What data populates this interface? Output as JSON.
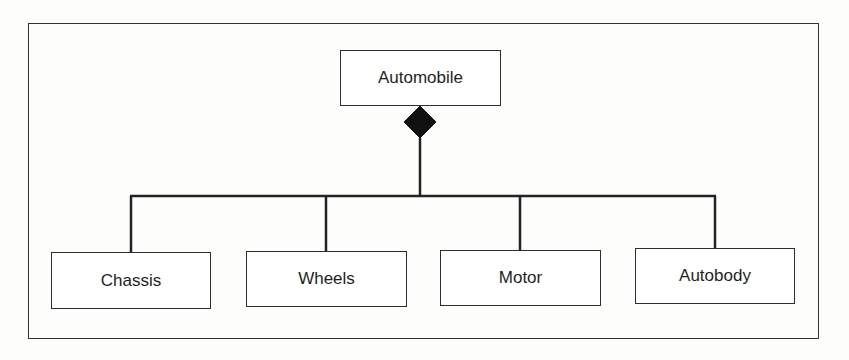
{
  "diagram": {
    "type": "uml-composition",
    "parent": {
      "label": "Automobile"
    },
    "relationship": {
      "kind": "composition",
      "marker": "filled-diamond-icon"
    },
    "children": [
      {
        "label": "Chassis"
      },
      {
        "label": "Wheels"
      },
      {
        "label": "Motor"
      },
      {
        "label": "Autobody"
      }
    ]
  },
  "colors": {
    "line": "#222222",
    "box_border": "#2e2e2e",
    "text": "#1f1f1f",
    "background": "#fdfdfc"
  }
}
